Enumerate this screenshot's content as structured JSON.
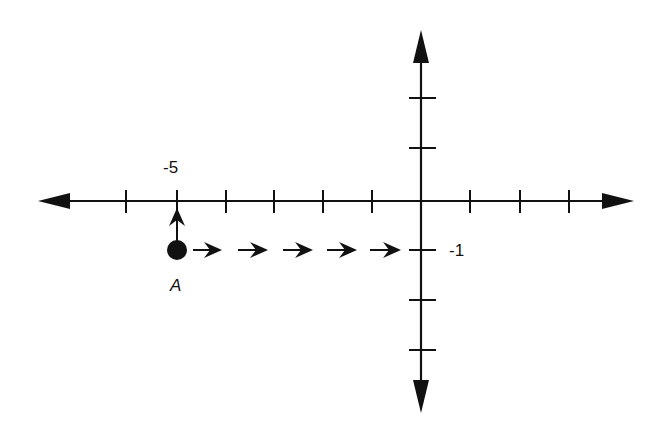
{
  "diagram": {
    "type": "coordinate-plane",
    "origin_px": [
      421,
      201
    ],
    "unit_px": 49,
    "x_axis": {
      "ticks": [
        -6,
        -5,
        -4,
        -3,
        -2,
        -1,
        1,
        2,
        3
      ],
      "label_tick": "-5"
    },
    "y_axis": {
      "ticks": [
        2,
        1,
        -1,
        -2,
        -3
      ],
      "label_tick": "-1"
    },
    "point": {
      "label": "A",
      "coords": [
        -5,
        -1
      ]
    },
    "path": {
      "up_arrows": 1,
      "right_arrows": 5,
      "description": "From A move 1 unit up, or 5 units right"
    }
  },
  "labels": {
    "x_tick_label": "-5",
    "y_tick_label": "-1",
    "point_label": "A"
  },
  "colors": {
    "stroke": "#111111",
    "background": "#ffffff"
  }
}
